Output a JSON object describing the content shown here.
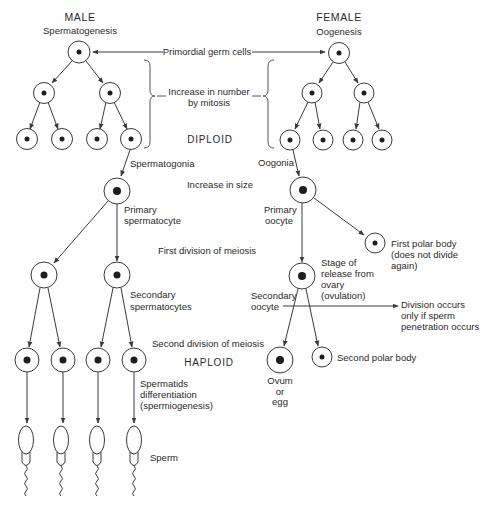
{
  "headings": {
    "male": "MALE",
    "male_process": "Spermatogenesis",
    "female": "FEMALE",
    "female_process": "Oogenesis"
  },
  "stages": {
    "primordial": "Primordial germ cells",
    "mitosis_line1": "Increase in number",
    "mitosis_line2": "by mitosis",
    "diploid": "DIPLOID",
    "size": "Increase in size",
    "first_meiosis": "First division of meiosis",
    "second_meiosis": "Second division of meiosis",
    "haploid": "HAPLOID"
  },
  "male_labels": {
    "spermatogonia": "Spermatogonia",
    "primary_line1": "Primary",
    "primary_line2": "spermatocyte",
    "secondary_line1": "Secondary",
    "secondary_line2": "spermatocytes",
    "spermatids_line1": "Spermatids",
    "spermatids_line2": "differentiation",
    "spermatids_line3": "(spermiogenesis)",
    "sperm": "Sperm"
  },
  "female_labels": {
    "oogonia": "Oogonia",
    "primary_line1": "Primary",
    "primary_line2": "oocyte",
    "first_polar_line1": "First polar body",
    "first_polar_line2": "(does not divide",
    "first_polar_line3": "again)",
    "release_line1": "Stage of",
    "release_line2": "release from",
    "release_line3": "ovary",
    "release_line4": "(ovulation)",
    "secondary_line1": "Secondary",
    "secondary_line2": "oocyte",
    "division_line1": "Division occurs",
    "division_line2": "only if sperm",
    "division_line3": "penetration occurs",
    "second_polar": "Second polar body",
    "ovum_line1": "Ovum",
    "ovum_line2": "or",
    "ovum_line3": "egg"
  },
  "colors": {
    "line": "#3a3a3a",
    "nucleus": "#1e1e1e",
    "text": "#2a2a2a",
    "background": "#ffffff"
  }
}
